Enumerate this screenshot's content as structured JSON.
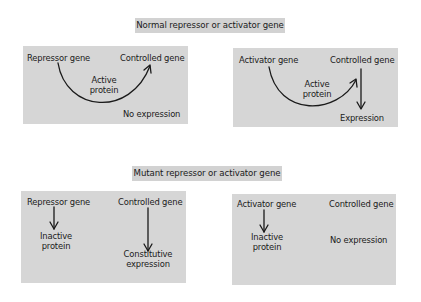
{
  "diagram": {
    "normal_section": {
      "title": "Normal repressor or activator gene",
      "repressor_panel": {
        "source_gene": "Repressor gene",
        "target_gene": "Controlled gene",
        "protein_line1": "Active",
        "protein_line2": "protein",
        "outcome": "No expression",
        "arrow": "curved arrow from repressor gene to controlled gene"
      },
      "activator_panel": {
        "source_gene": "Activator gene",
        "target_gene": "Controlled gene",
        "protein_line1": "Active",
        "protein_line2": "protein",
        "outcome": "Expression",
        "arrow": "curved arrow from activator gene to controlled gene; straight arrow down to expression"
      }
    },
    "mutant_section": {
      "title": "Mutant repressor or activator gene",
      "repressor_panel": {
        "source_gene": "Repressor gene",
        "target_gene": "Controlled gene",
        "protein_line1": "Inactive",
        "protein_line2": "protein",
        "outcome_line1": "Constitutive",
        "outcome_line2": "expression"
      },
      "activator_panel": {
        "source_gene": "Activator gene",
        "target_gene": "Controlled gene",
        "protein_line1": "Inactive",
        "protein_line2": "protein",
        "outcome": "No expression"
      }
    },
    "colors": {
      "panel_bg": "#d6d6d6",
      "title_bg": "#d2d2d2",
      "ink": "#1a1a1a",
      "page_bg": "#ffffff"
    }
  }
}
